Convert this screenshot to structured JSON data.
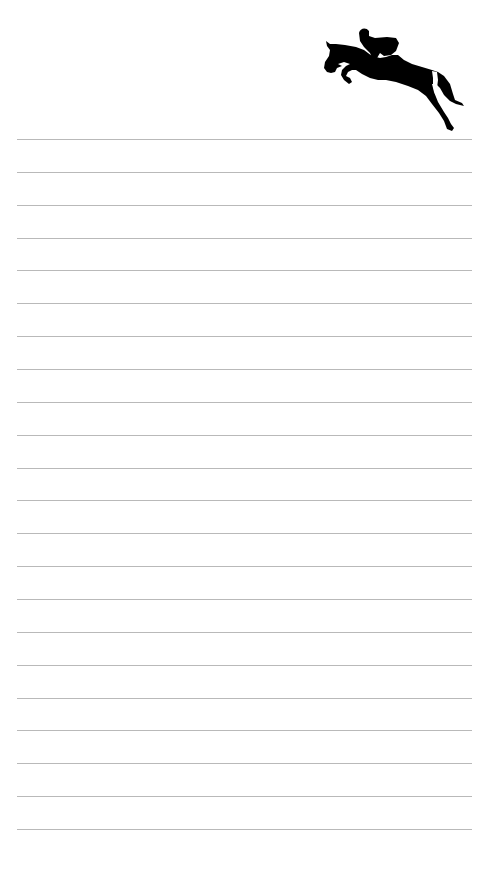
{
  "page": {
    "type": "lined-notepad",
    "background_color": "#ffffff",
    "line_color": "#b9b9b9",
    "line_count": 22,
    "first_line_y": 139,
    "line_spacing": 32.86
  },
  "decoration": {
    "icon": "horse-jumping-rider-silhouette-icon",
    "color": "#000000"
  }
}
